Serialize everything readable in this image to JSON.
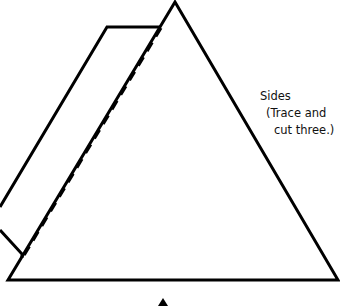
{
  "diagram": {
    "title": "Sides",
    "instruction_line1": "(Trace and",
    "instruction_line2": "cut three.)",
    "stroke_color": "#000000",
    "background_color": "#ffffff"
  }
}
